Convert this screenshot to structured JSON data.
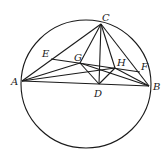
{
  "figure": {
    "type": "geometry",
    "colors": {
      "stroke": "#1a1a1a",
      "background": "#ffffff"
    },
    "circle": {
      "cx": 86,
      "cy": 84,
      "rx": 65,
      "ry": 64
    },
    "points": [
      {
        "id": "A",
        "label": "A",
        "x": 22,
        "y": 81,
        "lx": 11,
        "ly": 85
      },
      {
        "id": "B",
        "label": "B",
        "x": 149,
        "y": 86,
        "lx": 153,
        "ly": 90
      },
      {
        "id": "C",
        "label": "C",
        "x": 101,
        "y": 24,
        "lx": 102,
        "ly": 21
      },
      {
        "id": "D",
        "label": "D",
        "x": 99,
        "y": 84,
        "lx": 94,
        "ly": 97
      },
      {
        "id": "E",
        "label": "E",
        "x": 51,
        "y": 59,
        "lx": 42,
        "ly": 57
      },
      {
        "id": "F",
        "label": "F",
        "x": 140,
        "y": 72,
        "lx": 141,
        "ly": 70
      },
      {
        "id": "G",
        "label": "G",
        "x": 80,
        "y": 63,
        "lx": 74,
        "ly": 61
      },
      {
        "id": "H",
        "label": "H",
        "x": 115,
        "y": 68,
        "lx": 117,
        "ly": 66
      }
    ],
    "segments": [
      [
        "A",
        "B"
      ],
      [
        "A",
        "C"
      ],
      [
        "A",
        "G"
      ],
      [
        "A",
        "H"
      ],
      [
        "C",
        "G"
      ],
      [
        "C",
        "D"
      ],
      [
        "C",
        "H"
      ],
      [
        "C",
        "B"
      ],
      [
        "G",
        "D"
      ],
      [
        "D",
        "H"
      ],
      [
        "G",
        "B"
      ],
      [
        "H",
        "B"
      ],
      [
        "E",
        "F"
      ]
    ]
  }
}
